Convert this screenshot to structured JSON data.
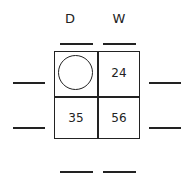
{
  "columns": [
    {
      "label": "D"
    },
    {
      "label": "W"
    }
  ],
  "grid": {
    "cells": [
      {
        "row": 0,
        "col": 0,
        "value": "",
        "content": "circle-icon"
      },
      {
        "row": 0,
        "col": 1,
        "value": "24"
      },
      {
        "row": 1,
        "col": 0,
        "value": "35"
      },
      {
        "row": 1,
        "col": 1,
        "value": "56"
      }
    ]
  },
  "blanks": {
    "top": [
      "",
      ""
    ],
    "left": [
      "",
      ""
    ],
    "right": [
      "",
      ""
    ],
    "bottom": [
      "",
      ""
    ]
  }
}
